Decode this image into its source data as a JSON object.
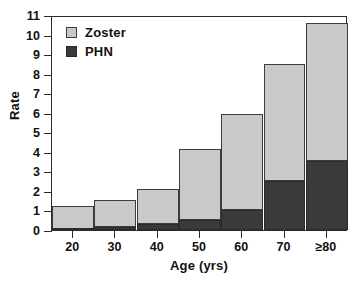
{
  "chart_data": {
    "type": "bar",
    "stacked": true,
    "title": "",
    "xlabel": "Age (yrs)",
    "ylabel": "Rate",
    "categories": [
      "20",
      "30",
      "40",
      "50",
      "60",
      "70",
      "≥80"
    ],
    "series": [
      {
        "name": "PHN",
        "color": "#3a3a3a",
        "values": [
          0.05,
          0.15,
          0.3,
          0.5,
          1.0,
          2.5,
          3.55
        ]
      },
      {
        "name": "Zoster",
        "color": "#c9c9c9",
        "values": [
          1.2,
          1.4,
          1.8,
          3.65,
          4.95,
          6.0,
          7.05
        ]
      }
    ],
    "totals": [
      1.25,
      1.55,
      2.1,
      4.15,
      5.95,
      8.5,
      10.6
    ],
    "ylim": [
      0,
      11
    ],
    "ytick_labels": [
      "0",
      "1",
      "2",
      "3",
      "4",
      "5",
      "6",
      "7",
      "8",
      "9",
      "10",
      "11"
    ],
    "ytick_values": [
      0,
      1,
      2,
      3,
      4,
      5,
      6,
      7,
      8,
      9,
      10,
      11
    ],
    "xtick_labels": [
      "20",
      "30",
      "40",
      "50",
      "60",
      "70",
      "≥80"
    ],
    "grid": false,
    "legend_position": "top-left",
    "legend": [
      {
        "label": "Zoster",
        "color": "#c9c9c9",
        "icon": "legend-swatch-zoster"
      },
      {
        "label": "PHN",
        "color": "#3a3a3a",
        "icon": "legend-swatch-phn"
      }
    ]
  }
}
